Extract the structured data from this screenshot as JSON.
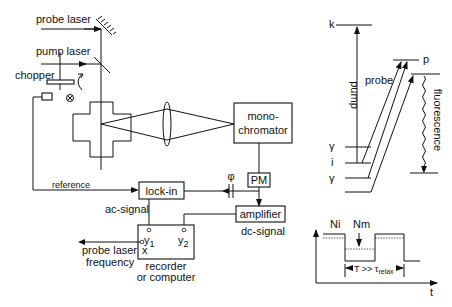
{
  "setup": {
    "probe_laser": "probe  laser",
    "pump_laser": "pump  laser",
    "chopper": "chopper",
    "monochromator_line1": "mono-",
    "monochromator_line2": "chromator",
    "pm": "PM",
    "phase": "φ",
    "reference": "reference",
    "lock_in": "lock-in",
    "amplifier": "amplifier",
    "ac_signal": "ac-signal",
    "dc_signal": "dc-signal",
    "y1": "y",
    "y1_sub": "1",
    "y2": "y",
    "y2_sub": "2",
    "x": "x",
    "probe_freq_line1": "probe laser",
    "probe_freq_line2": "frequency",
    "recorder_line1": "recorder",
    "recorder_line2": "or computer"
  },
  "levels": {
    "k": "k",
    "p": "p",
    "pump": "pump",
    "probe": "probe",
    "fluorescence": "fluorescence",
    "gamma_top": "γ",
    "i": "i",
    "gamma_bottom": "γ"
  },
  "timing": {
    "ni": "Ni",
    "nm": "Nm",
    "period": "T >> τ",
    "period_sub": "relax",
    "t_axis": "t"
  }
}
